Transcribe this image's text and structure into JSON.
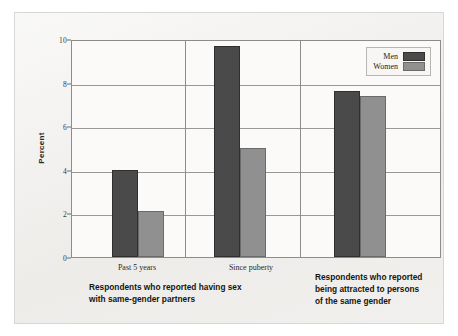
{
  "chart_data": {
    "type": "bar",
    "title": "",
    "xlabel": "",
    "ylabel": "Percent",
    "ylim": [
      0,
      10
    ],
    "yticks": [
      0,
      2,
      4,
      6,
      8,
      10
    ],
    "grid": true,
    "legend_position": "top-right",
    "categories": [
      "Past 5 years",
      "Since puberty",
      "Respondents who reported being attracted to persons of the same gender"
    ],
    "series": [
      {
        "name": "Men",
        "color": "#4a4a4a",
        "values": [
          4.0,
          9.7,
          7.6
        ]
      },
      {
        "name": "Women",
        "color": "#909090",
        "values": [
          2.1,
          5.0,
          7.4
        ]
      }
    ],
    "panels": [
      {
        "caption_lines": [
          "Respondents who reported having sex",
          "with same-gender partners"
        ],
        "tick_labels": [
          "Past 5 years",
          "Since puberty"
        ]
      },
      {
        "caption_lines": [
          "Respondents who reported",
          "being attracted to persons",
          "of the same gender"
        ],
        "tick_labels": []
      }
    ]
  },
  "axis": {
    "y_label": "Percent",
    "y_ticks": [
      "0",
      "2",
      "4",
      "6",
      "8",
      "10"
    ]
  },
  "legend": {
    "items": [
      {
        "label": "Men"
      },
      {
        "label": "Women"
      }
    ]
  },
  "xticks": [
    {
      "label": "Past 5 years"
    },
    {
      "label": "Since puberty"
    }
  ],
  "group_captions": {
    "left": {
      "line1": "Respondents who reported having sex",
      "line2": "with same-gender partners"
    },
    "right": {
      "line1": "Respondents who reported",
      "line2": "being attracted to persons",
      "line3": "of the same gender"
    }
  },
  "colors": {
    "men": "#4a4a4a",
    "women": "#909090",
    "background": "#f2f1ef",
    "plot_background": "#fbfaf8",
    "grid": "#9a9894",
    "axis": "#8e8c88"
  }
}
